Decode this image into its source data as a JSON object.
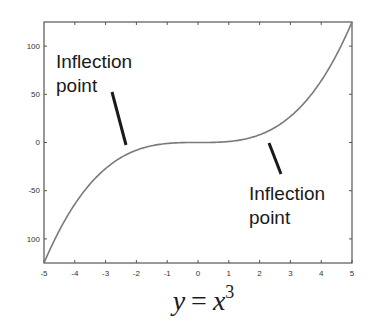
{
  "chart_data": {
    "type": "line",
    "xlabel": "",
    "ylabel": "",
    "xlim": [
      -5,
      5
    ],
    "ylim": [
      -125,
      125
    ],
    "grid": false,
    "legend": null,
    "x_ticks": [
      -5,
      -4,
      -3,
      -2,
      -1,
      0,
      1,
      2,
      3,
      4,
      5
    ],
    "y_ticks": [
      100,
      50,
      0,
      -50,
      -100
    ],
    "series": [
      {
        "name": "y = x^3",
        "x": [
          -5,
          -4.5,
          -4,
          -3.5,
          -3,
          -2.5,
          -2,
          -1.5,
          -1,
          -0.5,
          0,
          0.5,
          1,
          1.5,
          2,
          2.5,
          3,
          3.5,
          4,
          4.5,
          5
        ],
        "y": [
          -125,
          -91.1,
          -64,
          -42.9,
          -27,
          -15.6,
          -8,
          -3.4,
          -1,
          -0.1,
          0,
          0.1,
          1,
          3.4,
          8,
          15.6,
          27,
          42.9,
          64,
          91.1,
          125
        ],
        "color": "#777777"
      }
    ],
    "annotations": [
      {
        "text_line1": "Inflection",
        "text_line2": "point",
        "points_to_x": -2.4,
        "points_to_y": -14
      },
      {
        "text_line1": "Inflection",
        "text_line2": "point",
        "points_to_x": 2.3,
        "points_to_y": 12
      }
    ]
  },
  "labels": {
    "x_ticks": [
      "-5",
      "-4",
      "-3",
      "-2",
      "-1",
      "0",
      "1",
      "2",
      "3",
      "4",
      "5"
    ],
    "y_ticks": [
      "100",
      "50",
      "0",
      "-50",
      "100"
    ],
    "annotation_left": {
      "line1": "Inflection",
      "line2": "point"
    },
    "annotation_right": {
      "line1": "Inflection",
      "line2": "point"
    },
    "formula": {
      "lhs": "y",
      "eq": "=",
      "base": "x",
      "exp": "3"
    }
  },
  "colors": {
    "axis": "#555555",
    "curve": "#7a7a7a",
    "annotation_line": "#1a1a1a",
    "text": "#1a1a1a"
  }
}
